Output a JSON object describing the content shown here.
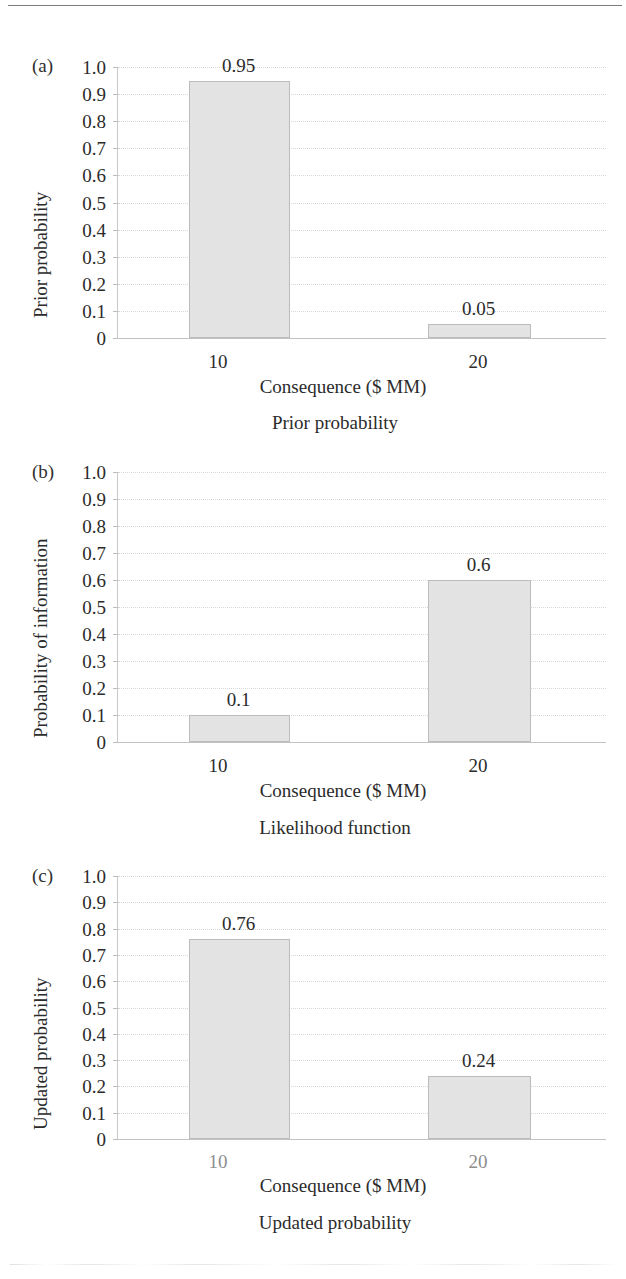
{
  "figure": {
    "panel_count": 3,
    "bar_fill_color": "#e3e3e3",
    "bar_border_color": "#bcbcbc",
    "gridline_color": "#d8d8d8"
  },
  "chart_data": [
    {
      "type": "bar",
      "panel_tag": "(a)",
      "title": "Prior probability",
      "xlabel": "Consequence ($ MM)",
      "ylabel": "Prior probability",
      "categories": [
        "10",
        "20"
      ],
      "values": [
        0.95,
        0.05
      ],
      "value_labels": [
        "0.95",
        "0.05"
      ],
      "ylim": [
        0,
        1.0
      ],
      "ytick_labels": [
        "1.0",
        "0.9",
        "0.8",
        "0.7",
        "0.6",
        "0.5",
        "0.4",
        "0.3",
        "0.2",
        "0.1",
        "0"
      ],
      "ytick_values": [
        1.0,
        0.9,
        0.8,
        0.7,
        0.6,
        0.5,
        0.4,
        0.3,
        0.2,
        0.1,
        0
      ],
      "grid": true,
      "legend": "none"
    },
    {
      "type": "bar",
      "panel_tag": "(b)",
      "title": "Likelihood function",
      "xlabel": "Consequence ($ MM)",
      "ylabel": "Probability of information",
      "categories": [
        "10",
        "20"
      ],
      "values": [
        0.1,
        0.6
      ],
      "value_labels": [
        "0.1",
        "0.6"
      ],
      "ylim": [
        0,
        1.0
      ],
      "ytick_labels": [
        "1.0",
        "0.9",
        "0.8",
        "0.7",
        "0.6",
        "0.5",
        "0.4",
        "0.3",
        "0.2",
        "0.1",
        "0"
      ],
      "ytick_values": [
        1.0,
        0.9,
        0.8,
        0.7,
        0.6,
        0.5,
        0.4,
        0.3,
        0.2,
        0.1,
        0
      ],
      "grid": true,
      "legend": "none"
    },
    {
      "type": "bar",
      "panel_tag": "(c)",
      "title": "Updated probability",
      "xlabel": "Consequence ($ MM)",
      "ylabel": "Updated probability",
      "categories": [
        "10",
        "20"
      ],
      "values": [
        0.76,
        0.24
      ],
      "value_labels": [
        "0.76",
        "0.24"
      ],
      "ylim": [
        0,
        1.0
      ],
      "ytick_labels": [
        "1.0",
        "0.9",
        "0.8",
        "0.7",
        "0.6",
        "0.5",
        "0.4",
        "0.3",
        "0.2",
        "0.1",
        "0"
      ],
      "ytick_values": [
        1.0,
        0.9,
        0.8,
        0.7,
        0.6,
        0.5,
        0.4,
        0.3,
        0.2,
        0.1,
        0
      ],
      "grid": true,
      "legend": "none"
    }
  ]
}
